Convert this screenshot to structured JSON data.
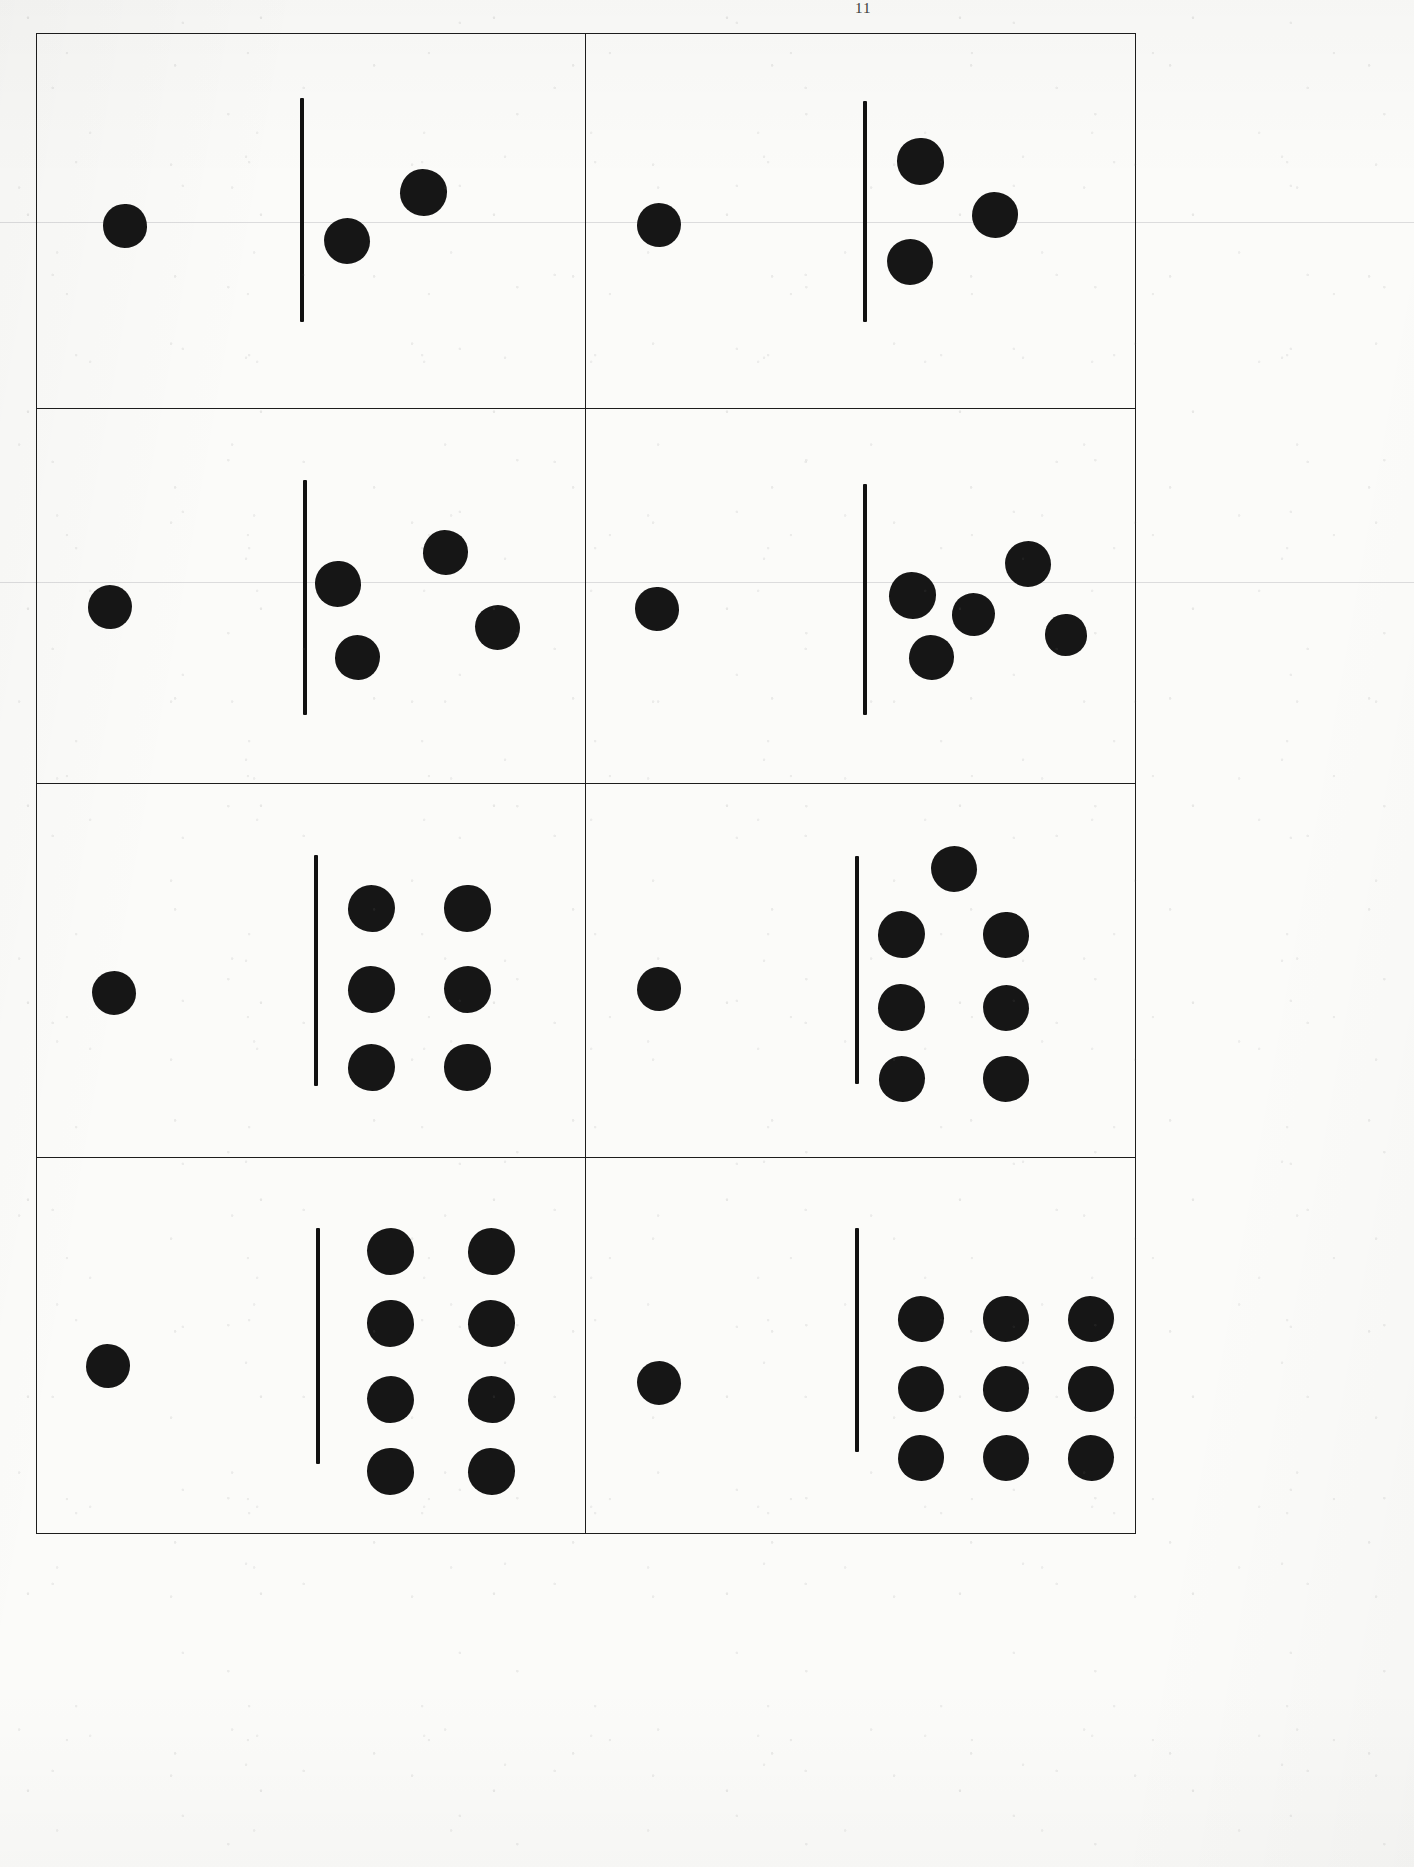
{
  "document": {
    "title": "Dot Quantity Comparison Worksheet",
    "page_mark": "11",
    "paper_color": "#fbfbf9",
    "ink_color": "#161616",
    "border_color": "#1d1d1d"
  },
  "layout": {
    "rows": 4,
    "columns": 2,
    "cell_count": 8,
    "grid_left": 36,
    "grid_top": 33,
    "grid_width": 1100,
    "grid_height": 1501
  },
  "scan_rules": [
    {
      "y": 222
    },
    {
      "y": 582
    }
  ],
  "cells": [
    {
      "id": "cell-1",
      "name": "comparison-cell-1",
      "row": 1,
      "column": 1,
      "left_count": 1,
      "right_count": 2,
      "comparison_label": "1 vs 2",
      "divider": {
        "x": 48.0,
        "y_top": 17.0,
        "height": 60.0,
        "thickness": 4
      },
      "left_dots": [
        {
          "cx": 32.0,
          "cy": 51.5,
          "d": 44
        }
      ],
      "right_dots": [
        {
          "cx": 70.5,
          "cy": 42.5,
          "d": 47
        },
        {
          "cx": 56.5,
          "cy": 55.5,
          "d": 46
        }
      ]
    },
    {
      "id": "cell-2",
      "name": "comparison-cell-2",
      "row": 1,
      "column": 2,
      "left_count": 1,
      "right_count": 3,
      "comparison_label": "1 vs 3",
      "divider": {
        "x": 50.5,
        "y_top": 18.0,
        "height": 59.0,
        "thickness": 4
      },
      "left_dots": [
        {
          "cx": 26.5,
          "cy": 51.0,
          "d": 44
        }
      ],
      "right_dots": [
        {
          "cx": 61.0,
          "cy": 34.0,
          "d": 47
        },
        {
          "cx": 74.5,
          "cy": 48.5,
          "d": 46
        },
        {
          "cx": 59.0,
          "cy": 61.0,
          "d": 46
        }
      ]
    },
    {
      "id": "cell-3",
      "name": "comparison-cell-3",
      "row": 2,
      "column": 1,
      "left_count": 1,
      "right_count": 4,
      "comparison_label": "1 vs 4",
      "divider": {
        "x": 48.5,
        "y_top": 19.0,
        "height": 63.0,
        "thickness": 4
      },
      "left_dots": [
        {
          "cx": 26.5,
          "cy": 53.0,
          "d": 44
        }
      ],
      "right_dots": [
        {
          "cx": 55.0,
          "cy": 47.0,
          "d": 46
        },
        {
          "cx": 74.5,
          "cy": 38.5,
          "d": 45
        },
        {
          "cx": 84.0,
          "cy": 58.5,
          "d": 45
        },
        {
          "cx": 58.5,
          "cy": 66.5,
          "d": 45
        }
      ]
    },
    {
      "id": "cell-4",
      "name": "comparison-cell-4",
      "row": 2,
      "column": 2,
      "left_count": 1,
      "right_count": 5,
      "comparison_label": "1 vs 5",
      "divider": {
        "x": 50.5,
        "y_top": 20.0,
        "height": 62.0,
        "thickness": 4
      },
      "left_dots": [
        {
          "cx": 26.0,
          "cy": 53.5,
          "d": 44
        }
      ],
      "right_dots": [
        {
          "cx": 59.5,
          "cy": 50.0,
          "d": 47
        },
        {
          "cx": 80.5,
          "cy": 41.5,
          "d": 46
        },
        {
          "cx": 70.5,
          "cy": 55.0,
          "d": 43
        },
        {
          "cx": 87.5,
          "cy": 60.5,
          "d": 42
        },
        {
          "cx": 63.0,
          "cy": 66.5,
          "d": 45
        }
      ]
    },
    {
      "id": "cell-5",
      "name": "comparison-cell-5",
      "row": 3,
      "column": 1,
      "left_count": 1,
      "right_count": 6,
      "comparison_label": "1 vs 6",
      "divider": {
        "x": 50.5,
        "y_top": 19.0,
        "height": 62.0,
        "thickness": 4
      },
      "left_dots": [
        {
          "cx": 28.0,
          "cy": 56.0,
          "d": 44
        }
      ],
      "right_dots": [
        {
          "cx": 61.0,
          "cy": 33.5,
          "d": 47
        },
        {
          "cx": 78.5,
          "cy": 33.5,
          "d": 47
        },
        {
          "cx": 61.0,
          "cy": 55.0,
          "d": 47
        },
        {
          "cx": 78.5,
          "cy": 55.0,
          "d": 47
        },
        {
          "cx": 61.0,
          "cy": 76.0,
          "d": 47
        },
        {
          "cx": 78.5,
          "cy": 76.0,
          "d": 47
        }
      ]
    },
    {
      "id": "cell-6",
      "name": "comparison-cell-6",
      "row": 3,
      "column": 2,
      "left_count": 1,
      "right_count": 7,
      "comparison_label": "1 vs 7",
      "divider": {
        "x": 49.0,
        "y_top": 19.5,
        "height": 61.0,
        "thickness": 4
      },
      "left_dots": [
        {
          "cx": 26.5,
          "cy": 55.0,
          "d": 44
        }
      ],
      "right_dots": [
        {
          "cx": 67.0,
          "cy": 23.0,
          "d": 46
        },
        {
          "cx": 57.5,
          "cy": 40.5,
          "d": 47
        },
        {
          "cx": 76.5,
          "cy": 40.5,
          "d": 46
        },
        {
          "cx": 57.5,
          "cy": 60.0,
          "d": 47
        },
        {
          "cx": 76.5,
          "cy": 60.0,
          "d": 46
        },
        {
          "cx": 57.5,
          "cy": 79.0,
          "d": 46
        },
        {
          "cx": 76.5,
          "cy": 79.0,
          "d": 46
        }
      ]
    },
    {
      "id": "cell-7",
      "name": "comparison-cell-7",
      "row": 4,
      "column": 1,
      "left_count": 1,
      "right_count": 8,
      "comparison_label": "1 vs 8",
      "divider": {
        "x": 51.0,
        "y_top": 18.5,
        "height": 63.0,
        "thickness": 4
      },
      "left_dots": [
        {
          "cx": 26.0,
          "cy": 55.5,
          "d": 44
        }
      ],
      "right_dots": [
        {
          "cx": 64.5,
          "cy": 25.0,
          "d": 47
        },
        {
          "cx": 83.0,
          "cy": 25.0,
          "d": 47
        },
        {
          "cx": 64.5,
          "cy": 44.0,
          "d": 47
        },
        {
          "cx": 83.0,
          "cy": 44.0,
          "d": 47
        },
        {
          "cx": 64.5,
          "cy": 64.5,
          "d": 47
        },
        {
          "cx": 83.0,
          "cy": 64.5,
          "d": 47
        },
        {
          "cx": 64.5,
          "cy": 83.5,
          "d": 47
        },
        {
          "cx": 83.0,
          "cy": 83.5,
          "d": 47
        }
      ]
    },
    {
      "id": "cell-8",
      "name": "comparison-cell-8",
      "row": 4,
      "column": 2,
      "left_count": 1,
      "right_count": 9,
      "comparison_label": "1 vs 9",
      "divider": {
        "x": 49.0,
        "y_top": 18.5,
        "height": 60.0,
        "thickness": 4
      },
      "left_dots": [
        {
          "cx": 26.5,
          "cy": 60.0,
          "d": 44
        }
      ],
      "right_dots": [
        {
          "cx": 61.0,
          "cy": 43.0,
          "d": 46
        },
        {
          "cx": 76.5,
          "cy": 43.0,
          "d": 46
        },
        {
          "cx": 92.0,
          "cy": 43.0,
          "d": 46
        },
        {
          "cx": 61.0,
          "cy": 61.5,
          "d": 46
        },
        {
          "cx": 76.5,
          "cy": 61.5,
          "d": 46
        },
        {
          "cx": 92.0,
          "cy": 61.5,
          "d": 46
        },
        {
          "cx": 61.0,
          "cy": 80.0,
          "d": 46
        },
        {
          "cx": 76.5,
          "cy": 80.0,
          "d": 46
        },
        {
          "cx": 92.0,
          "cy": 80.0,
          "d": 46
        }
      ]
    }
  ]
}
